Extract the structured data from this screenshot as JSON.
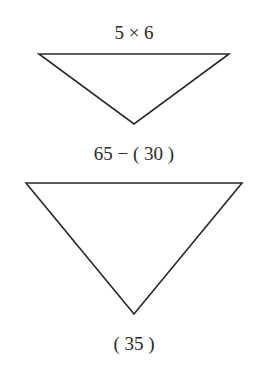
{
  "diagram": {
    "triangle_top": {
      "top_label": "5 × 6"
    },
    "middle_label": "65 − ( 30 )",
    "triangle_bottom": {
      "bottom_label": "( 35 )"
    },
    "stroke_color": "#2a2a2a",
    "background": "#ffffff"
  }
}
